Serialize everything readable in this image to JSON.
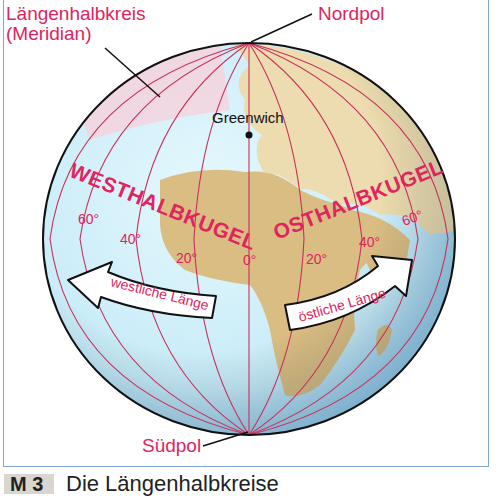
{
  "labels": {
    "meridian_title_line1": "Längenhalbkreis",
    "meridian_title_line2": "(Meridian)",
    "north_pole": "Nordpol",
    "south_pole": "Südpol",
    "greenwich": "Greenwich",
    "west_hemisphere": "WESTHALBKUGEL",
    "east_hemisphere": "OSTHALBKUGEL",
    "west_longitude": "westliche Länge",
    "east_longitude": "östliche Länge"
  },
  "degree_labels": {
    "w60": "60°",
    "w40": "40°",
    "w20": "20°",
    "zero": "0°",
    "e20": "20°",
    "e40": "40°",
    "e60": "60°"
  },
  "caption": {
    "number": "M 3",
    "text": "Die Längenhalbkreise"
  },
  "colors": {
    "label_red": "#e0245e",
    "meridian": "#c8305a",
    "ocean": "#cfeefa",
    "land": "#e8d6a6",
    "frame": "#7fa6d6"
  }
}
